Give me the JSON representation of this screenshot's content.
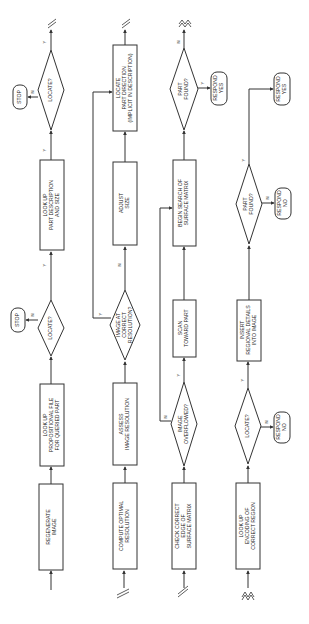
{
  "diagram": {
    "orientation": "rotated 90deg counter-clockwise; text reads bottom-to-top",
    "columns": [
      {
        "id": "row1",
        "nodes": [
          {
            "id": "regenerate",
            "type": "process",
            "lines": [
              "REGENERATE",
              "IMAGE"
            ]
          },
          {
            "id": "lookup-prop",
            "type": "process",
            "lines": [
              "LOOK UP",
              "PROPOSITIONAL FILE",
              "FOR QUERIED PART"
            ]
          },
          {
            "id": "locate1",
            "type": "decision",
            "lines": [
              "LOCATE?"
            ],
            "yes": "Y",
            "no": "N"
          },
          {
            "id": "stop1",
            "type": "terminal",
            "lines": [
              "STOP"
            ]
          },
          {
            "id": "lookup-desc",
            "type": "process",
            "lines": [
              "LOOK UP",
              "PART DESCRIPTION",
              "AND SIZE"
            ]
          },
          {
            "id": "locate2",
            "type": "decision",
            "lines": [
              "LOCATE?"
            ],
            "yes": "Y",
            "no": "N"
          },
          {
            "id": "stop2",
            "type": "terminal",
            "lines": [
              "STOP"
            ]
          }
        ]
      },
      {
        "id": "row2",
        "nodes": [
          {
            "id": "compute",
            "type": "process",
            "lines": [
              "COMPUTE OPTIMAL",
              "RESOLUTION"
            ]
          },
          {
            "id": "assess",
            "type": "process",
            "lines": [
              "ASSESS",
              "IMAGE RESOLUTION"
            ]
          },
          {
            "id": "image-correct",
            "type": "decision",
            "lines": [
              "IMAGE AT",
              "CORRECT",
              "RESOLUTION?"
            ],
            "yes": "Y",
            "no": "N"
          },
          {
            "id": "adjust",
            "type": "process",
            "lines": [
              "ADJUST",
              "SIZE"
            ]
          },
          {
            "id": "locate-dir",
            "type": "process",
            "lines": [
              "LOCATE",
              "PART DIRECTION",
              "(IMPLICIT IN DESCRIPTION)"
            ]
          }
        ]
      },
      {
        "id": "row3",
        "nodes": [
          {
            "id": "check-edge",
            "type": "process",
            "lines": [
              "CHECK CORRECT",
              "EDGE OF",
              "SURFACE MATRIX"
            ]
          },
          {
            "id": "overflowed",
            "type": "decision",
            "lines": [
              "IMAGE",
              "OVERFLOWED?"
            ],
            "yes": "Y",
            "no": "N"
          },
          {
            "id": "scan",
            "type": "process",
            "lines": [
              "SCAN",
              "TOWARD PART"
            ]
          },
          {
            "id": "begin-search",
            "type": "process",
            "lines": [
              "BEGIN SEARCH OF",
              "SURFACE MATRIX"
            ]
          },
          {
            "id": "found1",
            "type": "decision",
            "lines": [
              "PART",
              "FOUND?"
            ],
            "yes": "Y",
            "no": "N"
          },
          {
            "id": "respond-yes1",
            "type": "terminal",
            "lines": [
              "RESPOND",
              "YES"
            ]
          }
        ]
      },
      {
        "id": "row4",
        "nodes": [
          {
            "id": "lookup-enc",
            "type": "process",
            "lines": [
              "LOOK UP",
              "ENCODING OF",
              "CORRECT REGION"
            ]
          },
          {
            "id": "locate3",
            "type": "decision",
            "lines": [
              "LOCATE?"
            ],
            "yes": "Y",
            "no": "N"
          },
          {
            "id": "respond-no1",
            "type": "terminal",
            "lines": [
              "RESPOND",
              "NO"
            ]
          },
          {
            "id": "insert",
            "type": "process",
            "lines": [
              "INSERT",
              "REGIONAL DETAILS",
              "INTO IMAGE"
            ]
          },
          {
            "id": "found2",
            "type": "decision",
            "lines": [
              "PART",
              "FOUND?"
            ],
            "yes": "Y",
            "no": "N"
          },
          {
            "id": "respond-no2",
            "type": "terminal",
            "lines": [
              "RESPOND",
              "NO"
            ]
          },
          {
            "id": "respond-yes2",
            "type": "terminal",
            "lines": [
              "RESPOND",
              "YES"
            ]
          }
        ]
      }
    ],
    "connector_symbols": {
      "continuation_double_slash": "//",
      "continuation_zigzag": "≈"
    }
  },
  "t": {
    "regenerate": [
      "REGENERATE",
      "IMAGE"
    ],
    "lookup_prop": [
      "LOOK UP",
      "PROPOSITIONAL FILE",
      "FOR QUERIED PART"
    ],
    "locate": "LOCATE?",
    "stop": "STOP",
    "lookup_desc": [
      "LOOK UP",
      "PART DESCRIPTION",
      "AND SIZE"
    ],
    "compute": [
      "COMPUTE OPTIMAL",
      "RESOLUTION"
    ],
    "assess": [
      "ASSESS",
      "IMAGE RESOLUTION"
    ],
    "image_correct": [
      "IMAGE AT",
      "CORRECT",
      "RESOLUTION?"
    ],
    "adjust": [
      "ADJUST",
      "SIZE"
    ],
    "locate_dir": [
      "LOCATE",
      "PART DIRECTION",
      "(IMPLICIT IN DESCRIPTION)"
    ],
    "check_edge": [
      "CHECK CORRECT",
      "EDGE OF",
      "SURFACE MATRIX"
    ],
    "overflowed": [
      "IMAGE",
      "OVERFLOWED?"
    ],
    "scan": [
      "SCAN",
      "TOWARD PART"
    ],
    "begin_search": [
      "BEGIN SEARCH OF",
      "SURFACE MATRIX"
    ],
    "found": [
      "PART",
      "FOUND?"
    ],
    "respond_yes": [
      "RESPOND",
      "YES"
    ],
    "respond_no": [
      "RESPOND",
      "NO"
    ],
    "lookup_enc": [
      "LOOK UP",
      "ENCODING OF",
      "CORRECT REGION"
    ],
    "insert": [
      "INSERT",
      "REGIONAL DETAILS",
      "INTO IMAGE"
    ],
    "y": "Y",
    "n": "N"
  }
}
